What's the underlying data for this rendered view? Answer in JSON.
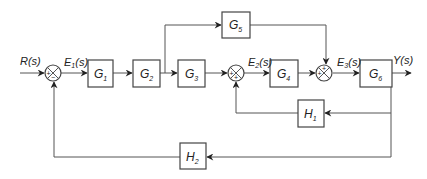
{
  "diagram": {
    "type": "control-system-block-diagram",
    "signals": {
      "input": {
        "name": "R",
        "arg": "(s)"
      },
      "e1": {
        "name": "E",
        "sub": "1",
        "arg": "(s)"
      },
      "e2": {
        "name": "E",
        "sub": "2",
        "arg": "(s)"
      },
      "e3": {
        "name": "E",
        "sub": "3",
        "arg": "(s)"
      },
      "output": {
        "name": "Y",
        "arg": "(s)"
      }
    },
    "blocks": [
      {
        "id": "G1",
        "name": "G",
        "sub": "1"
      },
      {
        "id": "G2",
        "name": "G",
        "sub": "2"
      },
      {
        "id": "G3",
        "name": "G",
        "sub": "3"
      },
      {
        "id": "G4",
        "name": "G",
        "sub": "4"
      },
      {
        "id": "G5",
        "name": "G",
        "sub": "5"
      },
      {
        "id": "G6",
        "name": "G",
        "sub": "6"
      },
      {
        "id": "H1",
        "name": "H",
        "sub": "1"
      },
      {
        "id": "H2",
        "name": "H",
        "sub": "2"
      }
    ],
    "summing_junctions": [
      {
        "id": "S1",
        "signs": {
          "left": "+",
          "bottom": "−"
        }
      },
      {
        "id": "S2",
        "signs": {
          "left": "+",
          "bottom": "+"
        }
      },
      {
        "id": "S3",
        "signs": {
          "left": "+",
          "top": "+"
        }
      }
    ],
    "connections": [
      "R(s) → S1(+)",
      "S1 → E1(s) → G1",
      "G1 → G2",
      "G2 → G3",
      "G2 → G5",
      "G3 → S2(+)",
      "S2 → E2(s) → G4",
      "G4 → S3(+)",
      "G5 → S3(+)",
      "S3 → E3(s) → G6",
      "G6 → Y(s)",
      "Y(s) → H1 → S2(+)",
      "Y(s) → H2 → S1(−)"
    ]
  }
}
